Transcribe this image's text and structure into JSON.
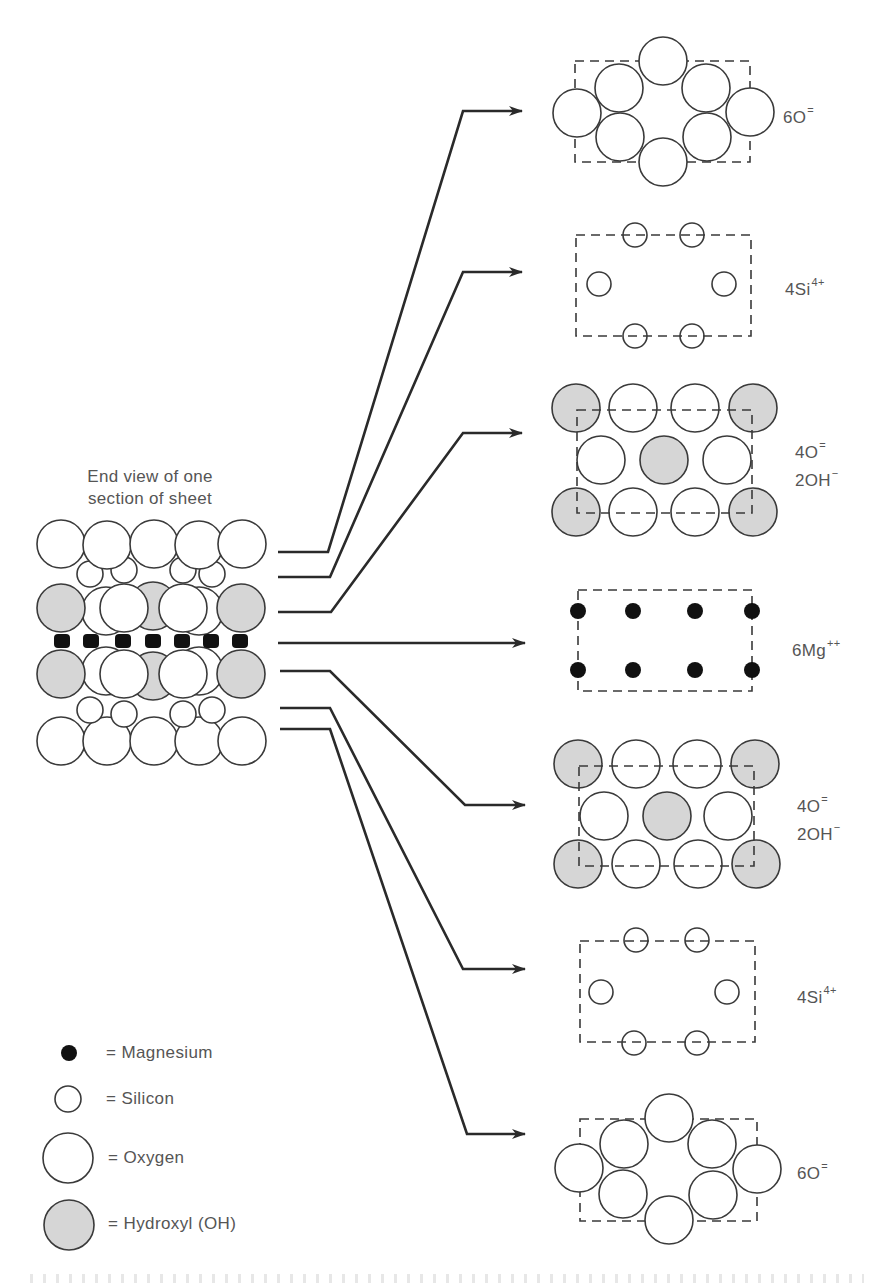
{
  "figure": {
    "section_title_line1": "End view of one",
    "section_title_line2": "section of sheet",
    "colors": {
      "outline": "#3a3a3a",
      "hydroxyl_fill": "#d6d6d6",
      "magnesium_fill": "#111111",
      "oxygen_fill": "#ffffff",
      "arrow": "#2a2a2a",
      "dash_box": "#3a3a3a",
      "label_text": "#555555"
    },
    "layers": [
      {
        "id": "layer-1",
        "label_main": "6O",
        "label_sup": "=",
        "label_line2": "",
        "label_sup2": "",
        "type": "oxygen-hex"
      },
      {
        "id": "layer-2",
        "label_main": "4Si",
        "label_sup": "4+",
        "label_line2": "",
        "label_sup2": "",
        "type": "silicon"
      },
      {
        "id": "layer-3",
        "label_main": "4O",
        "label_sup": "=",
        "label_line2": "2OH",
        "label_sup2": "−",
        "type": "oxygen-hydroxyl"
      },
      {
        "id": "layer-4",
        "label_main": "6Mg",
        "label_sup": "++",
        "label_line2": "",
        "label_sup2": "",
        "type": "magnesium"
      },
      {
        "id": "layer-5",
        "label_main": "4O",
        "label_sup": "=",
        "label_line2": "2OH",
        "label_sup2": "−",
        "type": "oxygen-hydroxyl"
      },
      {
        "id": "layer-6",
        "label_main": "4Si",
        "label_sup": "4+",
        "label_line2": "",
        "label_sup2": "",
        "type": "silicon"
      },
      {
        "id": "layer-7",
        "label_main": "6O",
        "label_sup": "=",
        "label_line2": "",
        "label_sup2": "",
        "type": "oxygen-hex"
      }
    ]
  },
  "legend": {
    "items": [
      {
        "symbol": "magnesium",
        "label": "= Magnesium"
      },
      {
        "symbol": "silicon",
        "label": "= Silicon"
      },
      {
        "symbol": "oxygen",
        "label": "= Oxygen"
      },
      {
        "symbol": "hydroxyl",
        "label": "= Hydroxyl (OH)"
      }
    ]
  }
}
